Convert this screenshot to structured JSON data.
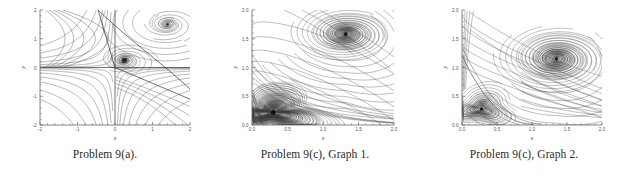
{
  "figure": {
    "background_color": "#ffffff",
    "curve_color": "#3a3a3a",
    "axis_color": "#666666",
    "tick_label_color": "#555555"
  },
  "panels": [
    {
      "id": "panel-a",
      "caption": "Problem 9(a).",
      "axis": {
        "xlabel": "x",
        "ylabel": "y",
        "xlim": [
          -2,
          2
        ],
        "ylim": [
          -2,
          2
        ],
        "xticks": [
          "-2",
          "-1",
          "0",
          "1",
          "2"
        ],
        "xtick_values": [
          -2,
          -1,
          0,
          1,
          2
        ],
        "yticks": [
          "2",
          "1",
          "0",
          "-1",
          "-2"
        ],
        "ytick_values": [
          2,
          1,
          0,
          -1,
          -2
        ],
        "grid": false
      }
    },
    {
      "id": "panel-b",
      "caption": "Problem 9(c), Graph 1.",
      "axis": {
        "xlabel": "x",
        "ylabel": "y",
        "xlim": [
          0,
          2
        ],
        "ylim": [
          0,
          2
        ],
        "xticks": [
          "0.0",
          "0.5",
          "1.0",
          "1.5",
          "2.0"
        ],
        "xtick_values": [
          0.0,
          0.5,
          1.0,
          1.5,
          2.0
        ],
        "yticks": [
          "2.0",
          "1.5",
          "1.0",
          "0.5",
          "0.0"
        ],
        "ytick_values": [
          2.0,
          1.5,
          1.0,
          0.5,
          0.0
        ],
        "grid": false
      }
    },
    {
      "id": "panel-c",
      "caption": "Problem 9(c), Graph 2.",
      "axis": {
        "xlabel": "x",
        "ylabel": "y",
        "xlim": [
          0,
          2
        ],
        "ylim": [
          0,
          2
        ],
        "xticks": [
          "0.0",
          "0.5",
          "1.0",
          "1.5",
          "2.0"
        ],
        "xtick_values": [
          0.0,
          0.5,
          1.0,
          1.5,
          2.0
        ],
        "yticks": [
          "2.0",
          "1.5",
          "1.0",
          "0.5",
          "0.0"
        ],
        "ytick_values": [
          2.0,
          1.5,
          1.0,
          0.5,
          0.0
        ],
        "grid": false
      }
    }
  ],
  "chart_data": [
    {
      "type": "line",
      "plot_kind": "phase-portrait",
      "title": "Problem 9(a).",
      "xlabel": "x",
      "ylabel": "y",
      "xlim": [
        -2,
        2
      ],
      "ylim": [
        -2,
        2
      ],
      "grid": false,
      "legend": null,
      "critical_points": [
        {
          "x": 0.0,
          "y": 0.0,
          "kind": "saddle",
          "marked": false
        },
        {
          "x": 0.25,
          "y": 0.25,
          "kind": "spiral-sink",
          "marked": true
        },
        {
          "x": 1.4,
          "y": 1.5,
          "kind": "spiral-sink",
          "marked": true
        }
      ],
      "separatrices": [
        {
          "description": "x-axis horizontal separatrix through origin",
          "points": [
            [
              -2,
              0
            ],
            [
              2,
              0
            ]
          ]
        },
        {
          "description": "y-axis vertical separatrix through origin",
          "points": [
            [
              0,
              -2
            ],
            [
              0,
              2
            ]
          ]
        },
        {
          "description": "diagonal separatrix entering saddle from upper-left",
          "points": [
            [
              -0.45,
              2
            ],
            [
              0.0,
              0.0
            ]
          ]
        },
        {
          "description": "diagonal separatrix leaving saddle to lower-right",
          "points": [
            [
              0.0,
              0.0
            ],
            [
              2,
              -1.1
            ]
          ]
        }
      ],
      "trajectories_note": "Family of nested trajectories: hyperbolic flow about the saddle at the origin, inward spirals to the two spiral sinks, and open curves sweeping the four quadrants."
    },
    {
      "type": "line",
      "plot_kind": "phase-portrait",
      "title": "Problem 9(c), Graph 1.",
      "xlabel": "x",
      "ylabel": "y",
      "xlim": [
        0,
        2
      ],
      "ylim": [
        0,
        2
      ],
      "grid": false,
      "legend": null,
      "critical_points": [
        {
          "x": 0.3,
          "y": 0.22,
          "kind": "spiral-sink",
          "marked": true,
          "density": "very-dense-triangular"
        },
        {
          "x": 1.32,
          "y": 1.58,
          "kind": "spiral-sink",
          "marked": true,
          "density": "dense-round"
        }
      ],
      "trajectories_note": "Trajectories spiral tightly into a triangular sink near (0.30, 0.22) hugging the x- and y-axes, and into a round spiral sink near (1.32, 1.58); remaining orbits sweep from the upper-left boundary toward the lower-right."
    },
    {
      "type": "line",
      "plot_kind": "phase-portrait",
      "title": "Problem 9(c), Graph 2.",
      "xlabel": "x",
      "ylabel": "y",
      "xlim": [
        0,
        2
      ],
      "ylim": [
        0,
        2
      ],
      "grid": false,
      "legend": null,
      "critical_points": [
        {
          "x": 0.28,
          "y": 0.28,
          "kind": "spiral-sink",
          "marked": true,
          "density": "open-oval"
        },
        {
          "x": 1.35,
          "y": 1.15,
          "kind": "spiral-sink",
          "marked": true,
          "density": "dense-round"
        }
      ],
      "trajectories_note": "Open oval spiral sink near (0.28, 0.28) bounded by a separatrix running from the y-axis to about (1.0, 0) on the x-axis; a round spiral sink near (1.35, 1.15); outer orbits arc from the top boundary down to the right boundary."
    }
  ]
}
